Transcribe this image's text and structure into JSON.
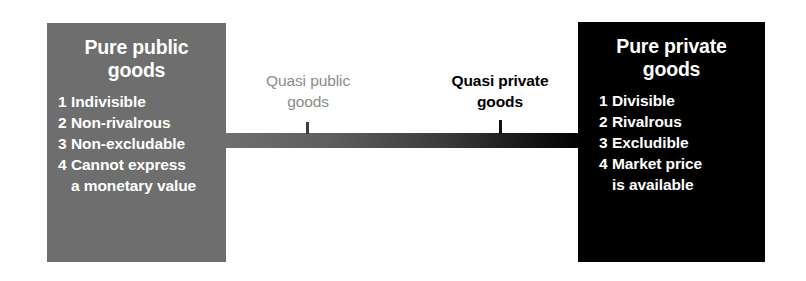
{
  "diagram": {
    "colors": {
      "public_box": "#6e6e6e",
      "private_box": "#000000",
      "quasi_public_text": "#8b8b8b",
      "quasi_private_text": "#000000",
      "background": "#ffffff"
    },
    "left_box": {
      "title_line1": "Pure public",
      "title_line2": "goods",
      "items": [
        {
          "num": "1",
          "text": "Indivisible",
          "cont": ""
        },
        {
          "num": "2",
          "text": "Non-rivalrous",
          "cont": ""
        },
        {
          "num": "3",
          "text": "Non-excludable",
          "cont": ""
        },
        {
          "num": "4",
          "text": "Cannot express",
          "cont": "a monetary value"
        }
      ]
    },
    "right_box": {
      "title_line1": "Pure private",
      "title_line2": "goods",
      "items": [
        {
          "num": "1",
          "text": "Divisible",
          "cont": ""
        },
        {
          "num": "2",
          "text": "Rivalrous",
          "cont": ""
        },
        {
          "num": "3",
          "text": "Excludible",
          "cont": ""
        },
        {
          "num": "4",
          "text": "Market price",
          "cont": "is available"
        }
      ]
    },
    "middle_labels": [
      {
        "line1": "Quasi public",
        "line2": "goods"
      },
      {
        "line1": "Quasi private",
        "line2": "goods"
      }
    ]
  }
}
